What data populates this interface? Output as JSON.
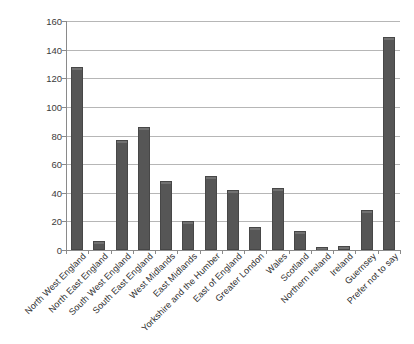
{
  "chart_data": {
    "type": "bar",
    "title": "",
    "xlabel": "",
    "ylabel": "",
    "ylim": [
      0,
      160
    ],
    "ytick_step": 20,
    "grid": true,
    "legend": "none",
    "bar_color": "#565656",
    "bar_edge_color": "#474747",
    "gridline_color": "#b6b6b6",
    "axis_color": "#8a8a8a",
    "label_rotation_deg": -45,
    "yticks": [
      "0",
      "20",
      "40",
      "60",
      "80",
      "100",
      "120",
      "140",
      "160"
    ],
    "categories": [
      "North West England",
      "North East England",
      "South West England",
      "South East England",
      "West Midlands",
      "East Midlands",
      "Yorkshire and the Humber",
      "East of England",
      "Greater London",
      "Wales",
      "Scotland",
      "Northern Ireland",
      "Ireland",
      "Guernsey",
      "Prefer not to say"
    ],
    "values": [
      128,
      6,
      77,
      86,
      48,
      20,
      52,
      42,
      16,
      43,
      13,
      2,
      3,
      28,
      149
    ]
  },
  "title_remnant": ""
}
